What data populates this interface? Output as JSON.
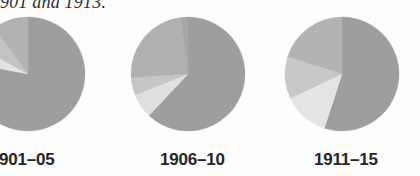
{
  "caption": {
    "fragment_text": "901 and 1913."
  },
  "colors": {
    "background": "#fdfdfd",
    "label_text": "#262626",
    "slice_dark": "#9e9e9e",
    "slice_mid": "#b4b4b4",
    "slice_light": "#c9c9c9",
    "slice_pale": "#e3e3e3"
  },
  "chart_data": {
    "type": "pie",
    "title": "901 and 1913.",
    "xlabel": "",
    "ylabel": "",
    "grid": false,
    "legend_position": "none",
    "charts": [
      {
        "label": "901–05",
        "center_x": 28,
        "center_y": 74,
        "radius": 57,
        "clipped_left": true,
        "start_angle_deg": -90,
        "categories": [
          "Series A",
          "Series B",
          "Series C",
          "Series D"
        ],
        "values": [
          78,
          5,
          7,
          10
        ],
        "slice_colors": [
          "#9e9e9e",
          "#e3e3e3",
          "#c3c3c3",
          "#b2b2b2"
        ]
      },
      {
        "label": "1906–10",
        "center_x": 188,
        "center_y": 74,
        "radius": 57,
        "clipped_left": false,
        "start_angle_deg": -90,
        "categories": [
          "Series A",
          "Series B",
          "Series C",
          "Series D",
          "Series E"
        ],
        "values": [
          62,
          7,
          5,
          24,
          2
        ],
        "slice_colors": [
          "#9e9e9e",
          "#e0e0e0",
          "#c6c6c6",
          "#b0b0b0",
          "#a6a6a6"
        ]
      },
      {
        "label": "1911–15",
        "center_x": 342,
        "center_y": 74,
        "radius": 57,
        "clipped_left": false,
        "start_angle_deg": -90,
        "categories": [
          "Series A",
          "Series B",
          "Series C",
          "Series D"
        ],
        "values": [
          55,
          13,
          12,
          20
        ],
        "slice_colors": [
          "#9e9e9e",
          "#e4e4e4",
          "#c8c8c8",
          "#b3b3b3"
        ]
      }
    ]
  }
}
